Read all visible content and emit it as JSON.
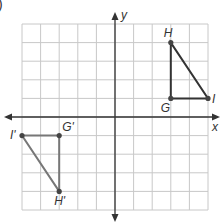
{
  "problem_marker": ")",
  "axes": {
    "x_label": "x",
    "y_label": "y"
  },
  "grid": {
    "xmin": -5,
    "xmax": 5,
    "ymin": -5,
    "ymax": 5,
    "unit_px": 18.6,
    "origin_px": [
      115,
      117
    ]
  },
  "colors": {
    "grid": "#c8c8c8",
    "axis": "#333333",
    "original_triangle": "#333333",
    "image_triangle": "#777777",
    "point": "#444444"
  },
  "original_triangle": {
    "points": [
      {
        "name": "H",
        "x": 3,
        "y": 4
      },
      {
        "name": "G",
        "x": 3,
        "y": 1
      },
      {
        "name": "I",
        "x": 5,
        "y": 1
      }
    ]
  },
  "image_triangle": {
    "points": [
      {
        "name": "H'",
        "x": -3,
        "y": -4
      },
      {
        "name": "G'",
        "x": -3,
        "y": -1
      },
      {
        "name": "I'",
        "x": -5,
        "y": -1
      }
    ]
  }
}
